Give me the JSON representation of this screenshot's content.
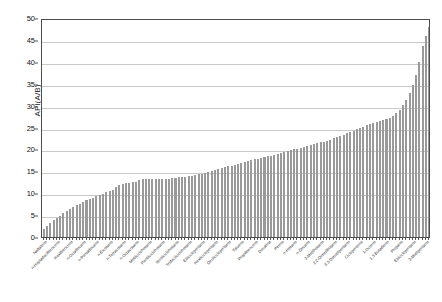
{
  "chart_data": {
    "type": "bar",
    "title": "",
    "xlabel": "",
    "ylabel": "API(A/B)",
    "ylim": [
      0,
      50
    ],
    "yticks": [
      0,
      5,
      10,
      15,
      20,
      25,
      30,
      35,
      40,
      45,
      50
    ],
    "grid": true,
    "legend": null,
    "bar_color": "#9a9a9a",
    "categories": [
      "Naftaleno",
      "n-Butilbenceno",
      "n-Decilbenceno",
      "Tetradecilbenceno",
      "n-Heptadecilbenceno",
      "n-Nonilbenceno",
      "Etilbenceno",
      "Pentilbenceno",
      "Hexilbenceno",
      "n-Dodecilbenceno",
      "n-Metilciclopentano",
      "n-Heptadecano",
      "n-Octadecano",
      "n-Tridecano",
      "n-Undecano",
      "n-Tetradecano",
      "n-Pentadecano",
      "n-Hexadecano",
      "n-Dodecano",
      "n-Nonadecano",
      "n-Eicosano",
      "n-Heneicosano",
      "n-Docosano",
      "n-Tricosano",
      "n-Tetracosano",
      "n-Pentacosano",
      "n-Hexacosano",
      "n-Heptacosano",
      "n-Octacosano",
      "n-Nonacosano",
      "n-Triacontano",
      "Ciclohexano",
      "Metilciclohexano",
      "Etilciclohexano",
      "Propilciclohexano",
      "Butilciclohexano",
      "Pentilciclohexano",
      "Hexilciclohexano",
      "Heptilciclohexano",
      "Octilciclohexano",
      "Nonilciclohexano",
      "Decilciclohexano",
      "Undecilciclohexano",
      "Dodecilciclohexano",
      "Tridecilciclohexano",
      "Tetradecilciclohexano",
      "Ciclopentano",
      "Metilciclopentano",
      "Etilciclopentano",
      "Propilciclopentano",
      "Butilciclopentano",
      "Pentilciclopentano",
      "Hexilciclopentano",
      "Heptilciclopentano",
      "Octilciclopentano",
      "Nonilciclopentano",
      "Decilciclopentano",
      "Undecilciclopentano",
      "Dodecilciclopentano",
      "Benceno",
      "Tolueno",
      "o-Xileno",
      "m-Xileno",
      "p-Xileno",
      "Propilbenceno",
      "Cumeno",
      "Indano",
      "Tetralina",
      "Decalina",
      "Bifenilo",
      "Fenantreno",
      "Antraceno",
      "Pireno",
      "Fluoreno",
      "Acenafteno",
      "n-Pentano",
      "n-Hexano",
      "n-Heptano",
      "n-Octano",
      "n-Nonano",
      "n-Decano",
      "2-Metilpentano",
      "3-Metilpentano",
      "2-Metilhexano",
      "3-Metilhexano",
      "2-Metilheptano",
      "3-Metilheptano",
      "4-Metilheptano",
      "2,2-Dimetilbutano",
      "2,3-Dimetilbutano",
      "2,2-Dimetilpentano",
      "2,4-Dimetilpentano",
      "3,3-Dimetilpentano",
      "2,3-Dimetilpentano",
      "2,2,3-Trimetilbutano",
      "Isooctano",
      "Ciclopenteno",
      "Ciclohexeno",
      "1-Hexeno",
      "1-Hepteno",
      "1-Octeno",
      "1-Noneno",
      "1-Deceno",
      "Isopreno",
      "1,3-Butadieno",
      "Isobutano",
      "n-Butano",
      "Propeno",
      "Propano",
      "Etilbenceno",
      "Etano",
      "Metilciclopentano",
      "Etilciclopentano",
      "Metilciclopentano",
      "2-Metilbutano",
      "2-Metilbutano",
      "3-Metilpentano",
      "Neopentano"
    ],
    "values": [
      1.9,
      2.6,
      3.3,
      3.9,
      4.4,
      4.9,
      5.4,
      5.9,
      6.4,
      6.8,
      7.2,
      7.6,
      8.0,
      8.4,
      8.7,
      9.0,
      9.3,
      9.6,
      9.9,
      10.2,
      10.5,
      10.7,
      11.5,
      11.9,
      12.1,
      12.3,
      12.4,
      12.5,
      12.6,
      13.1,
      13.2,
      13.2,
      13.3,
      13.3,
      13.3,
      13.3,
      13.3,
      13.3,
      13.3,
      13.4,
      13.5,
      13.6,
      13.7,
      13.8,
      13.9,
      14.0,
      14.1,
      14.3,
      14.5,
      14.7,
      14.9,
      15.1,
      15.3,
      15.5,
      15.7,
      15.9,
      16.1,
      16.3,
      16.5,
      16.7,
      16.9,
      17.1,
      17.3,
      17.5,
      17.7,
      17.9,
      18.0,
      18.2,
      18.4,
      18.6,
      18.8,
      19.0,
      19.2,
      19.4,
      19.6,
      19.8,
      20.0,
      20.2,
      20.4,
      20.6,
      20.8,
      21.0,
      21.2,
      21.4,
      21.6,
      21.8,
      22.0,
      22.2,
      22.5,
      22.8,
      23.1,
      23.4,
      23.7,
      24.0,
      24.3,
      24.6,
      24.9,
      25.2,
      25.5,
      25.8,
      26.1,
      26.3,
      26.5,
      26.7,
      26.9,
      27.1,
      27.6,
      28.3,
      29.1,
      30.1,
      31.3,
      32.9,
      34.6,
      37.0,
      39.9,
      43.6,
      46.0,
      48.0
    ]
  }
}
